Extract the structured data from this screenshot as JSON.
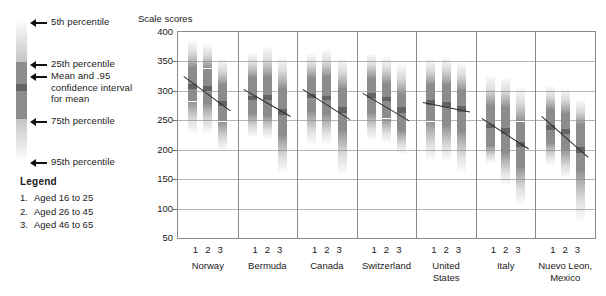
{
  "key": {
    "annotations": [
      {
        "id": "p5",
        "label": "5th percentile"
      },
      {
        "id": "p25",
        "label": "25th percentile"
      },
      {
        "id": "mean",
        "label": "Mean and .95\nconfidence interval\nfor mean"
      },
      {
        "id": "p75",
        "label": "75th percentile"
      },
      {
        "id": "p95",
        "label": "95th percentile"
      }
    ]
  },
  "legend": {
    "title": "Legend",
    "items": [
      {
        "num": "1.",
        "label": "Aged 16 to 25"
      },
      {
        "num": "2.",
        "label": "Aged 26 to 45"
      },
      {
        "num": "3.",
        "label": "Aged 46 to 65"
      }
    ]
  },
  "chart_data": {
    "type": "bar",
    "title": "",
    "subtitle": "",
    "xlabel": "",
    "ylabel": "Scale scores",
    "ylim": [
      50,
      400
    ],
    "yticks": [
      400,
      350,
      300,
      250,
      200,
      150,
      100,
      50
    ],
    "grid": true,
    "legend_position": "left",
    "categories": [
      "Norway",
      "Bermuda",
      "Canada",
      "Switzerland",
      "United States",
      "Italy",
      "Nuevo Leon, Mexico"
    ],
    "age_groups": [
      "1",
      "2",
      "3"
    ],
    "age_group_labels": [
      "Aged 16 to 25",
      "Aged 26 to 45",
      "Aged 46 to 65"
    ],
    "colors": {
      "iqr_band": "#8c8c8c",
      "ci_band": "#636363",
      "tail_gradient": "#c8c8c8",
      "trend_line": "#2b2b2b",
      "gridline": "#b4b4b4",
      "frame": "#8a8a8a"
    },
    "series": [
      {
        "name": "Norway",
        "groups": [
          {
            "age": "1",
            "p5": 228,
            "p25": 282,
            "mean": 307,
            "ci_low": 303,
            "ci_high": 311,
            "p75": 340,
            "p95": 384
          },
          {
            "age": "2",
            "p5": 229,
            "p25": 277,
            "mean": 304,
            "ci_low": 300,
            "ci_high": 308,
            "p75": 338,
            "p95": 379
          },
          {
            "age": "3",
            "p5": 198,
            "p25": 248,
            "mean": 279,
            "ci_low": 275,
            "ci_high": 283,
            "p75": 312,
            "p95": 355
          }
        ],
        "trend_start": 325,
        "trend_end": 266
      },
      {
        "name": "Bermuda",
        "groups": [
          {
            "age": "1",
            "p5": 222,
            "p25": 261,
            "mean": 288,
            "ci_low": 284,
            "ci_high": 292,
            "p75": 323,
            "p95": 364
          },
          {
            "age": "2",
            "p5": 219,
            "p25": 258,
            "mean": 289,
            "ci_low": 285,
            "ci_high": 293,
            "p75": 326,
            "p95": 374
          },
          {
            "age": "3",
            "p5": 162,
            "p25": 223,
            "mean": 264,
            "ci_low": 259,
            "ci_high": 269,
            "p75": 305,
            "p95": 357
          }
        ],
        "trend_start": 303,
        "trend_end": 257
      },
      {
        "name": "Canada",
        "groups": [
          {
            "age": "1",
            "p5": 209,
            "p25": 264,
            "mean": 291,
            "ci_low": 287,
            "ci_high": 295,
            "p75": 323,
            "p95": 362
          },
          {
            "age": "2",
            "p5": 209,
            "p25": 259,
            "mean": 288,
            "ci_low": 284,
            "ci_high": 292,
            "p75": 326,
            "p95": 370
          },
          {
            "age": "3",
            "p5": 160,
            "p25": 232,
            "mean": 267,
            "ci_low": 262,
            "ci_high": 272,
            "p75": 305,
            "p95": 354
          }
        ],
        "trend_start": 303,
        "trend_end": 252
      },
      {
        "name": "Switzerland",
        "groups": [
          {
            "age": "1",
            "p5": 216,
            "p25": 262,
            "mean": 292,
            "ci_low": 288,
            "ci_high": 296,
            "p75": 322,
            "p95": 363
          },
          {
            "age": "2",
            "p5": 213,
            "p25": 253,
            "mean": 286,
            "ci_low": 282,
            "ci_high": 290,
            "p75": 313,
            "p95": 357
          },
          {
            "age": "3",
            "p5": 193,
            "p25": 232,
            "mean": 268,
            "ci_low": 263,
            "ci_high": 273,
            "p75": 294,
            "p95": 345
          }
        ],
        "trend_start": 296,
        "trend_end": 249
      },
      {
        "name": "United States",
        "groups": [
          {
            "age": "1",
            "p5": 183,
            "p25": 248,
            "mean": 280,
            "ci_low": 276,
            "ci_high": 284,
            "p75": 311,
            "p95": 355
          },
          {
            "age": "2",
            "p5": 181,
            "p25": 241,
            "mean": 277,
            "ci_low": 273,
            "ci_high": 281,
            "p75": 311,
            "p95": 357
          },
          {
            "age": "3",
            "p5": 162,
            "p25": 230,
            "mean": 269,
            "ci_low": 264,
            "ci_high": 274,
            "p75": 301,
            "p95": 348
          }
        ],
        "trend_start": 282,
        "trend_end": 266
      },
      {
        "name": "Italy",
        "groups": [
          {
            "age": "1",
            "p5": 178,
            "p25": 207,
            "mean": 240,
            "ci_low": 236,
            "ci_high": 244,
            "p75": 276,
            "p95": 325
          },
          {
            "age": "2",
            "p5": 140,
            "p25": 194,
            "mean": 232,
            "ci_low": 227,
            "ci_high": 237,
            "p75": 273,
            "p95": 322
          },
          {
            "age": "3",
            "p5": 110,
            "p25": 169,
            "mean": 209,
            "ci_low": 204,
            "ci_high": 214,
            "p75": 248,
            "p95": 305
          }
        ],
        "trend_start": 254,
        "trend_end": 202
      },
      {
        "name": "Nuevo Leon, Mexico",
        "groups": [
          {
            "age": "1",
            "p5": 174,
            "p25": 211,
            "mean": 238,
            "ci_low": 234,
            "ci_high": 242,
            "p75": 270,
            "p95": 309
          },
          {
            "age": "2",
            "p5": 152,
            "p25": 200,
            "mean": 231,
            "ci_low": 226,
            "ci_high": 236,
            "p75": 263,
            "p95": 303
          },
          {
            "age": "3",
            "p5": 78,
            "p25": 164,
            "mean": 199,
            "ci_low": 194,
            "ci_high": 204,
            "p75": 243,
            "p95": 285
          }
        ],
        "trend_start": 258,
        "trend_end": 188
      }
    ]
  }
}
